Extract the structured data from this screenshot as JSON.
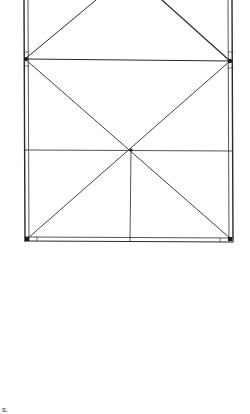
{
  "diagram": {
    "type": "truss-frame",
    "stroke_color": "#2a2a2a",
    "background": "#ffffff",
    "nodes": {
      "top_left_exit": [
        96,
        0
      ],
      "top_right_exit": [
        162,
        0
      ],
      "mid_left": [
        25,
        59
      ],
      "mid_right": [
        230,
        61
      ],
      "center": [
        131,
        150
      ],
      "bottom_left": [
        27,
        239
      ],
      "bottom_mid": [
        130,
        239
      ],
      "bottom_right": [
        231,
        239
      ]
    },
    "footnote_mark": "s."
  }
}
